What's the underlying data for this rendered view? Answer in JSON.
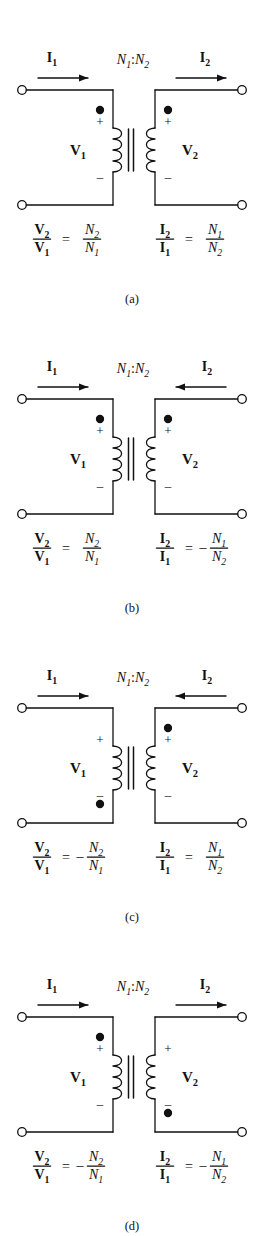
{
  "figure": {
    "panel_count": 4,
    "background_color": "#ffffff",
    "ink_color": "#111111"
  },
  "labels": {
    "i1": "I",
    "i1_sub": "1",
    "i2": "I",
    "i2_sub": "2",
    "v1": "V",
    "v1_sub": "1",
    "v2": "V",
    "v2_sub": "2",
    "ratio_n1": "N",
    "ratio_n1_sub": "1",
    "ratio_colon": ":",
    "ratio_n2": "N",
    "ratio_n2_sub": "2",
    "plus": "+",
    "minus": "–",
    "equals": "=",
    "neg": "–"
  },
  "panels": [
    {
      "id": "a",
      "caption": "(a)",
      "ratio_label": "N1:N2",
      "current_1": {
        "label": "I1",
        "direction": "right",
        "meaning": "into-primary"
      },
      "current_2": {
        "label": "I2",
        "direction": "right",
        "meaning": "out-of-secondary"
      },
      "dot_primary": "top",
      "dot_secondary": "top",
      "polarity_primary": {
        "top": "+",
        "bottom": "–"
      },
      "polarity_secondary": {
        "top": "+",
        "bottom": "–"
      },
      "equation_voltage": {
        "numerator": "V2",
        "denominator": "V1",
        "sign": "",
        "rhs_numerator": "N2",
        "rhs_denominator": "N1",
        "text": "V2/V1 = N2/N1"
      },
      "equation_current": {
        "numerator": "I2",
        "denominator": "I1",
        "sign": "",
        "rhs_numerator": "N1",
        "rhs_denominator": "N2",
        "text": "I2/I1 = N1/N2"
      }
    },
    {
      "id": "b",
      "caption": "(b)",
      "ratio_label": "N1:N2",
      "current_1": {
        "label": "I1",
        "direction": "right",
        "meaning": "into-primary"
      },
      "current_2": {
        "label": "I2",
        "direction": "left",
        "meaning": "into-secondary"
      },
      "dot_primary": "top",
      "dot_secondary": "top",
      "polarity_primary": {
        "top": "+",
        "bottom": "–"
      },
      "polarity_secondary": {
        "top": "+",
        "bottom": "–"
      },
      "equation_voltage": {
        "numerator": "V2",
        "denominator": "V1",
        "sign": "",
        "rhs_numerator": "N2",
        "rhs_denominator": "N1",
        "text": "V2/V1 = N2/N1"
      },
      "equation_current": {
        "numerator": "I2",
        "denominator": "I1",
        "sign": "–",
        "rhs_numerator": "N1",
        "rhs_denominator": "N2",
        "text": "I2/I1 = -N1/N2"
      }
    },
    {
      "id": "c",
      "caption": "(c)",
      "ratio_label": "N1:N2",
      "current_1": {
        "label": "I1",
        "direction": "right",
        "meaning": "into-primary"
      },
      "current_2": {
        "label": "I2",
        "direction": "left",
        "meaning": "into-secondary"
      },
      "dot_primary": "bottom",
      "dot_secondary": "top",
      "polarity_primary": {
        "top": "+",
        "bottom": "–"
      },
      "polarity_secondary": {
        "top": "+",
        "bottom": "–"
      },
      "equation_voltage": {
        "numerator": "V2",
        "denominator": "V1",
        "sign": "–",
        "rhs_numerator": "N2",
        "rhs_denominator": "N1",
        "text": "V2/V1 = -N2/N1"
      },
      "equation_current": {
        "numerator": "I2",
        "denominator": "I1",
        "sign": "",
        "rhs_numerator": "N1",
        "rhs_denominator": "N2",
        "text": "I2/I1 = N1/N2"
      }
    },
    {
      "id": "d",
      "caption": "(d)",
      "ratio_label": "N1:N2",
      "current_1": {
        "label": "I1",
        "direction": "right",
        "meaning": "into-primary"
      },
      "current_2": {
        "label": "I2",
        "direction": "right",
        "meaning": "out-of-secondary"
      },
      "dot_primary": "top",
      "dot_secondary": "bottom",
      "polarity_primary": {
        "top": "+",
        "bottom": "–"
      },
      "polarity_secondary": {
        "top": "+",
        "bottom": "–"
      },
      "equation_voltage": {
        "numerator": "V2",
        "denominator": "V1",
        "sign": "–",
        "rhs_numerator": "N2",
        "rhs_denominator": "N1",
        "text": "V2/V1 = -N2/N1"
      },
      "equation_current": {
        "numerator": "I2",
        "denominator": "I1",
        "sign": "–",
        "rhs_numerator": "N1",
        "rhs_denominator": "N2",
        "text": "I2/I1 = -N1/N2"
      }
    }
  ]
}
